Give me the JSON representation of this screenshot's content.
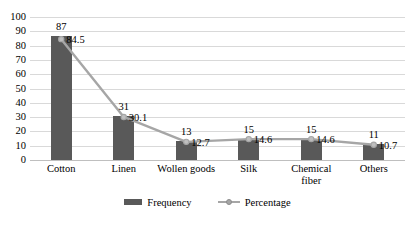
{
  "chart_data": {
    "type": "bar",
    "title": "",
    "subtitle": "",
    "xlabel": "",
    "ylabel": "",
    "ylim": [
      0,
      100
    ],
    "ystep": 10,
    "grid": "horizontal",
    "legend_position": "bottom-center",
    "categories": [
      "Cotton",
      "Linen",
      "Wollen goods",
      "Silk",
      "Chemical fiber",
      "Others"
    ],
    "yticks": [
      "0",
      "10",
      "20",
      "30",
      "40",
      "50",
      "60",
      "70",
      "80",
      "90",
      "100"
    ],
    "series": [
      {
        "name": "Frequency",
        "type": "bar",
        "color": "#595959",
        "values": [
          87,
          31,
          13,
          15,
          15,
          11
        ],
        "labels": [
          "87",
          "31",
          "13",
          "15",
          "15",
          "11"
        ]
      },
      {
        "name": "Percentage",
        "type": "line",
        "color": "#a6a6a6",
        "marker": "circle",
        "values": [
          84.5,
          30.1,
          12.7,
          14.6,
          14.6,
          10.7
        ],
        "labels": [
          "84.5",
          "30.1",
          "12.7",
          "14.6",
          "14.6",
          "10.7"
        ]
      }
    ]
  },
  "legend": {
    "items": [
      {
        "label": "Frequency",
        "swatch": "bar-swatch-icon"
      },
      {
        "label": "Percentage",
        "swatch": "line-marker-icon"
      }
    ]
  }
}
